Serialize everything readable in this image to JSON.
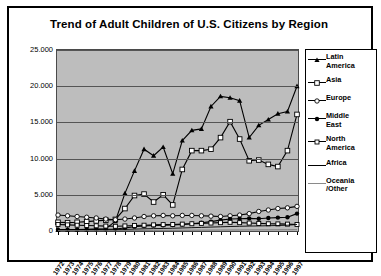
{
  "chart_data": {
    "type": "line",
    "title": "Trend of Adult Children of U.S. Citizens by Region",
    "xlabel": "",
    "ylabel": "",
    "grid": true,
    "legend_position": "right",
    "ylim": [
      0,
      25000
    ],
    "yticks": [
      0,
      5000,
      10000,
      15000,
      20000,
      25000
    ],
    "ytick_labels": [
      "0",
      "5.000",
      "10.000",
      "15.000",
      "20.000",
      "25.000"
    ],
    "categories": [
      "1972",
      "1973",
      "1974",
      "1975",
      "1976",
      "1977",
      "1978",
      "1979",
      "1980",
      "1981",
      "1982",
      "1983",
      "1984",
      "1985",
      "1986",
      "1987",
      "1988",
      "1989",
      "1990",
      "1991",
      "1992",
      "1993",
      "1994",
      "1995",
      "1996",
      "1997"
    ],
    "series": [
      {
        "name": "Latin America",
        "marker": "filled-triangle",
        "values": [
          180,
          200,
          210,
          230,
          260,
          300,
          1350,
          5200,
          8300,
          11300,
          10400,
          11600,
          7900,
          12500,
          13900,
          14100,
          17200,
          18600,
          18400,
          18000,
          12900,
          14600,
          15400,
          16200,
          16500,
          20000
        ]
      },
      {
        "name": "Asia",
        "marker": "open-square",
        "values": [
          1200,
          1150,
          1200,
          1300,
          1400,
          1500,
          1600,
          3100,
          4900,
          5100,
          4000,
          5000,
          3600,
          8500,
          11100,
          11100,
          11300,
          12900,
          15100,
          12700,
          9700,
          9800,
          9200,
          8900,
          11100,
          16100
        ]
      },
      {
        "name": "Europe",
        "marker": "open-circle",
        "values": [
          2200,
          2100,
          2000,
          1900,
          1800,
          1650,
          1550,
          1650,
          1800,
          2000,
          2100,
          2150,
          2100,
          2150,
          2150,
          2100,
          2050,
          2000,
          2100,
          2200,
          2400,
          2700,
          2900,
          3100,
          3200,
          3400
        ]
      },
      {
        "name": "Middle East",
        "marker": "filled-circle",
        "values": [
          180,
          190,
          200,
          210,
          230,
          250,
          280,
          420,
          600,
          700,
          760,
          800,
          820,
          900,
          1000,
          1150,
          1300,
          1500,
          1650,
          1700,
          1750,
          1700,
          1800,
          1850,
          1900,
          2400
        ]
      },
      {
        "name": "North America",
        "marker": "open-square-small",
        "values": [
          900,
          850,
          800,
          760,
          720,
          680,
          650,
          700,
          760,
          800,
          850,
          880,
          900,
          950,
          1000,
          1050,
          1100,
          1150,
          1200,
          1150,
          1100,
          1050,
          1000,
          980,
          950,
          900
        ]
      },
      {
        "name": "Africa",
        "marker": "none",
        "values": [
          120,
          130,
          140,
          150,
          160,
          170,
          190,
          220,
          260,
          300,
          330,
          350,
          380,
          420,
          460,
          500,
          540,
          580,
          620,
          650,
          680,
          700,
          730,
          760,
          800,
          900
        ]
      },
      {
        "name": "Oceania/Other",
        "marker": "none",
        "values": [
          60,
          62,
          65,
          68,
          70,
          72,
          75,
          80,
          85,
          90,
          95,
          100,
          105,
          110,
          115,
          120,
          125,
          130,
          135,
          140,
          145,
          150,
          155,
          160,
          165,
          175
        ]
      }
    ]
  },
  "legend": {
    "items": [
      {
        "label_line1": "Latin",
        "label_line2": "America"
      },
      {
        "label_line1": "Asia",
        "label_line2": ""
      },
      {
        "label_line1": "Europe",
        "label_line2": ""
      },
      {
        "label_line1": "Middle",
        "label_line2": "East"
      },
      {
        "label_line1": "North",
        "label_line2": "America"
      },
      {
        "label_line1": "Africa",
        "label_line2": ""
      },
      {
        "label_line1": "Oceania",
        "label_line2": "/Other"
      }
    ]
  }
}
